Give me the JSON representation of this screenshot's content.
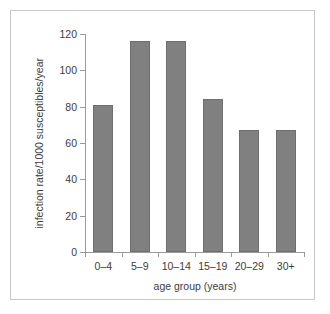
{
  "chart_data": {
    "type": "bar",
    "title": "",
    "categories": [
      "0–4",
      "5–9",
      "10–14",
      "15–19",
      "20–29",
      "30+"
    ],
    "values": [
      81,
      116,
      116,
      84,
      67,
      67
    ],
    "xlabel": "age group (years)",
    "ylabel": "infection rate/1000 susceptibles/year",
    "ylim": [
      0,
      120
    ],
    "yticks": [
      0,
      20,
      40,
      60,
      80,
      100,
      120
    ],
    "ytick_labels": [
      "0",
      "20",
      "40",
      "60",
      "80",
      "100",
      "120"
    ],
    "grid": false,
    "legend": null,
    "bar_color": "#808080",
    "axis_color": "#9a9a9a",
    "text_color": "#3c3c3c",
    "frame_color": "#c8c8c8"
  }
}
